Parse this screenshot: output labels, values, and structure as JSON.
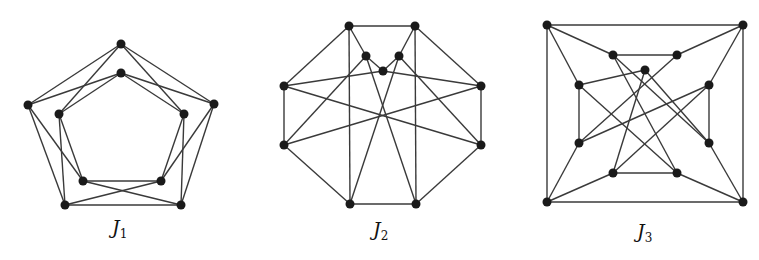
{
  "figure": {
    "graphs": [
      {
        "id": "J1",
        "label_main": "J",
        "label_sub": "1",
        "label_pos": [
          112,
          242
        ],
        "nodes": {
          "OT": [
            121,
            44
          ],
          "IT": [
            121,
            73
          ],
          "OL": [
            28,
            105
          ],
          "IL": [
            59,
            114
          ],
          "OR": [
            214,
            104
          ],
          "IR": [
            184,
            114
          ],
          "IBL": [
            83,
            181
          ],
          "IBR": [
            161,
            181
          ],
          "OBL": [
            65,
            205
          ],
          "OBR": [
            181,
            205
          ]
        },
        "edges": [
          [
            "OT",
            "OL"
          ],
          [
            "OT",
            "OR"
          ],
          [
            "OT",
            "IL"
          ],
          [
            "OT",
            "IR"
          ],
          [
            "IT",
            "OL"
          ],
          [
            "IT",
            "OR"
          ],
          [
            "IT",
            "IL"
          ],
          [
            "IT",
            "IR"
          ],
          [
            "OL",
            "OBL"
          ],
          [
            "OL",
            "IBL"
          ],
          [
            "IL",
            "OBL"
          ],
          [
            "IL",
            "IBL"
          ],
          [
            "OR",
            "OBR"
          ],
          [
            "OR",
            "IBR"
          ],
          [
            "IR",
            "OBR"
          ],
          [
            "IR",
            "IBR"
          ],
          [
            "IBL",
            "IBR"
          ],
          [
            "OBL",
            "OBR"
          ],
          [
            "IBL",
            "OBR"
          ],
          [
            "IBR",
            "OBL"
          ]
        ]
      },
      {
        "id": "J2",
        "label_main": "J",
        "label_sub": "2",
        "label_pos": [
          373,
          244
        ],
        "nodes": {
          "TL": [
            349,
            26
          ],
          "TR": [
            415,
            26
          ],
          "IL": [
            366,
            56
          ],
          "IR": [
            399,
            56
          ],
          "C": [
            383,
            71
          ],
          "ML": [
            284,
            86
          ],
          "MR": [
            481,
            86
          ],
          "LL": [
            284,
            145
          ],
          "LR": [
            481,
            145
          ],
          "BL": [
            350,
            204
          ],
          "BR": [
            416,
            204
          ]
        },
        "edges": [
          [
            "TL",
            "TR"
          ],
          [
            "TL",
            "ML"
          ],
          [
            "TL",
            "BL"
          ],
          [
            "TL",
            "IL"
          ],
          [
            "TR",
            "MR"
          ],
          [
            "TR",
            "BR"
          ],
          [
            "TR",
            "IR"
          ],
          [
            "IL",
            "C"
          ],
          [
            "IR",
            "C"
          ],
          [
            "IL",
            "LL"
          ],
          [
            "IL",
            "BR"
          ],
          [
            "IR",
            "LR"
          ],
          [
            "IR",
            "BL"
          ],
          [
            "C",
            "ML"
          ],
          [
            "C",
            "MR"
          ],
          [
            "ML",
            "LL"
          ],
          [
            "ML",
            "LR"
          ],
          [
            "MR",
            "LR"
          ],
          [
            "MR",
            "LL"
          ],
          [
            "LL",
            "BL"
          ],
          [
            "LR",
            "BR"
          ],
          [
            "BL",
            "BR"
          ]
        ]
      },
      {
        "id": "J3",
        "label_main": "J",
        "label_sub": "3",
        "label_pos": [
          637,
          246
        ],
        "nodes": {
          "OTL": [
            547,
            25
          ],
          "OTR": [
            743,
            25
          ],
          "OBL": [
            547,
            202
          ],
          "OBR": [
            743,
            202
          ],
          "ITL": [
            613,
            55
          ],
          "ITR": [
            677,
            55
          ],
          "C": [
            645,
            70
          ],
          "IML": [
            579,
            85
          ],
          "IMR": [
            709,
            85
          ],
          "ILL": [
            579,
            143
          ],
          "ILR": [
            709,
            143
          ],
          "IBL": [
            613,
            173
          ],
          "IBR": [
            677,
            173
          ]
        },
        "edges": [
          [
            "OTL",
            "OTR"
          ],
          [
            "OTL",
            "OBL"
          ],
          [
            "OTR",
            "OBR"
          ],
          [
            "OBL",
            "OBR"
          ],
          [
            "OTL",
            "ITL"
          ],
          [
            "OTL",
            "IML"
          ],
          [
            "OTR",
            "ITR"
          ],
          [
            "OTR",
            "IMR"
          ],
          [
            "OBL",
            "ILL"
          ],
          [
            "OBL",
            "IBL"
          ],
          [
            "OBR",
            "ILR"
          ],
          [
            "OBR",
            "IBR"
          ],
          [
            "ITL",
            "ITR"
          ],
          [
            "IML",
            "ILL"
          ],
          [
            "IMR",
            "ILR"
          ],
          [
            "IBL",
            "IBR"
          ],
          [
            "ITL",
            "ILR"
          ],
          [
            "ITL",
            "IBR"
          ],
          [
            "ITR",
            "ILL"
          ],
          [
            "C",
            "IML"
          ],
          [
            "C",
            "IBL"
          ],
          [
            "C",
            "ILR"
          ],
          [
            "IMR",
            "ILL"
          ],
          [
            "IMR",
            "IBL"
          ],
          [
            "IML",
            "IBR"
          ]
        ]
      }
    ],
    "style": {
      "edge_color": "#3a3a3a",
      "node_color": "#1a1a1a",
      "node_radius": 4.5
    }
  }
}
